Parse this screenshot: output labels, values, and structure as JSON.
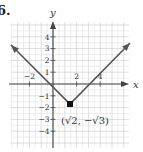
{
  "problem_number": "6.",
  "chart_data": {
    "type": "line",
    "title": "",
    "xlabel": "x",
    "ylabel": "y",
    "xlim": [
      -3.5,
      6.5
    ],
    "ylim": [
      -5.5,
      5.3
    ],
    "grid": true,
    "x_ticks": [
      -2,
      2,
      4
    ],
    "y_ticks": [
      4,
      3,
      2,
      1,
      -1,
      -2,
      -3,
      -4
    ],
    "series": [
      {
        "name": "V-shaped graph",
        "points": [
          [
            -3.6,
            3.3
          ],
          [
            1.41,
            -1.73
          ],
          [
            6.5,
            3.4
          ]
        ],
        "arrows": "both"
      }
    ],
    "annotations": [
      {
        "label": "(√2, −√3)",
        "point": [
          1.41,
          -1.73
        ],
        "marker": "filled-circle"
      }
    ]
  }
}
